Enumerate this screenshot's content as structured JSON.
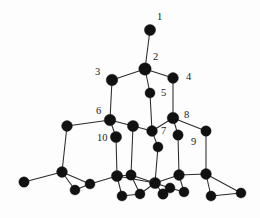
{
  "figure": {
    "name": "crystal-lattice-diagram",
    "background_color": "#fdfdfd",
    "atom_color": "#111111",
    "bond_color": "#2b2b2b",
    "label_color": "#1a1a1a",
    "width": 260,
    "height": 218
  },
  "chart_data": {
    "type": "scatter",
    "title": "",
    "subtitle": "",
    "xlabel": "",
    "ylabel": "",
    "xlim": [
      0,
      260
    ],
    "ylim": [
      0,
      218
    ],
    "grid": false,
    "legend": null,
    "atom_radius_large": 5.6,
    "atom_radius_small": 4.6,
    "nodes": [
      {
        "id": "n1",
        "label": "1",
        "x": 150,
        "y": 30,
        "r": 5.6,
        "label_x": 157,
        "label_y": 12
      },
      {
        "id": "n2",
        "label": "2",
        "x": 145,
        "y": 69,
        "r": 6.2,
        "label_x": 153,
        "label_y": 52
      },
      {
        "id": "n3",
        "label": "3",
        "x": 112,
        "y": 80,
        "r": 5.8,
        "label_x": 95,
        "label_y": 67
      },
      {
        "id": "n4",
        "label": "4",
        "x": 173,
        "y": 78,
        "r": 5.4,
        "label_x": 186,
        "label_y": 72
      },
      {
        "id": "n5",
        "label": "5",
        "x": 150,
        "y": 93,
        "r": 5.0,
        "label_x": 161,
        "label_y": 88
      },
      {
        "id": "n6",
        "label": "6",
        "x": 110,
        "y": 120,
        "r": 5.8,
        "label_x": 96,
        "label_y": 106
      },
      {
        "id": "n7",
        "label": "7",
        "x": 152,
        "y": 131,
        "r": 5.4,
        "label_x": 161,
        "label_y": 126
      },
      {
        "id": "n8",
        "label": "8",
        "x": 173,
        "y": 118,
        "r": 5.8,
        "label_x": 184,
        "label_y": 110
      },
      {
        "id": "n9",
        "label": "9",
        "x": 178,
        "y": 135,
        "r": 5.2,
        "label_x": 191,
        "label_y": 137
      },
      {
        "id": "n10",
        "label": "10",
        "x": 116,
        "y": 137,
        "r": 5.6,
        "label_x": 97,
        "label_y": 133
      },
      {
        "id": "a1",
        "label": "",
        "x": 133,
        "y": 126,
        "r": 5.6,
        "label_x": null,
        "label_y": null
      },
      {
        "id": "a2",
        "label": "",
        "x": 67,
        "y": 126,
        "r": 5.4,
        "label_x": null,
        "label_y": null
      },
      {
        "id": "a3",
        "label": "",
        "x": 206,
        "y": 131,
        "r": 5.2,
        "label_x": null,
        "label_y": null
      },
      {
        "id": "a4",
        "label": "",
        "x": 158,
        "y": 147,
        "r": 5.0,
        "label_x": null,
        "label_y": null
      },
      {
        "id": "a5",
        "label": "",
        "x": 62,
        "y": 172,
        "r": 5.4,
        "label_x": null,
        "label_y": null
      },
      {
        "id": "a6",
        "label": "",
        "x": 24,
        "y": 182,
        "r": 5.2,
        "label_x": null,
        "label_y": null
      },
      {
        "id": "a7",
        "label": "",
        "x": 75,
        "y": 190,
        "r": 5.0,
        "label_x": null,
        "label_y": null
      },
      {
        "id": "a8",
        "label": "",
        "x": 90,
        "y": 184,
        "r": 5.0,
        "label_x": null,
        "label_y": null
      },
      {
        "id": "a9",
        "label": "",
        "x": 117,
        "y": 176,
        "r": 5.6,
        "label_x": null,
        "label_y": null
      },
      {
        "id": "a10",
        "label": "",
        "x": 131,
        "y": 175,
        "r": 5.2,
        "label_x": null,
        "label_y": null
      },
      {
        "id": "a11",
        "label": "",
        "x": 122,
        "y": 196,
        "r": 5.0,
        "label_x": null,
        "label_y": null
      },
      {
        "id": "a12",
        "label": "",
        "x": 140,
        "y": 194,
        "r": 5.0,
        "label_x": null,
        "label_y": null
      },
      {
        "id": "a13",
        "label": "",
        "x": 155,
        "y": 183,
        "r": 5.6,
        "label_x": null,
        "label_y": null
      },
      {
        "id": "a14",
        "label": "",
        "x": 163,
        "y": 194,
        "r": 5.2,
        "label_x": null,
        "label_y": null
      },
      {
        "id": "a15",
        "label": "",
        "x": 170,
        "y": 188,
        "r": 5.0,
        "label_x": null,
        "label_y": null
      },
      {
        "id": "a16",
        "label": "",
        "x": 179,
        "y": 175,
        "r": 5.4,
        "label_x": null,
        "label_y": null
      },
      {
        "id": "a17",
        "label": "",
        "x": 184,
        "y": 192,
        "r": 5.0,
        "label_x": null,
        "label_y": null
      },
      {
        "id": "a18",
        "label": "",
        "x": 206,
        "y": 174,
        "r": 5.4,
        "label_x": null,
        "label_y": null
      },
      {
        "id": "a19",
        "label": "",
        "x": 211,
        "y": 196,
        "r": 5.0,
        "label_x": null,
        "label_y": null
      },
      {
        "id": "a20",
        "label": "",
        "x": 241,
        "y": 193,
        "r": 5.0,
        "label_x": null,
        "label_y": null
      }
    ],
    "edges": [
      [
        "n1",
        "n2"
      ],
      [
        "n2",
        "n3"
      ],
      [
        "n2",
        "n4"
      ],
      [
        "n2",
        "n5"
      ],
      [
        "n3",
        "n6"
      ],
      [
        "n4",
        "n8"
      ],
      [
        "n5",
        "n7"
      ],
      [
        "n6",
        "a1"
      ],
      [
        "n6",
        "n10"
      ],
      [
        "n6",
        "a2"
      ],
      [
        "a1",
        "n7"
      ],
      [
        "n7",
        "n8"
      ],
      [
        "n7",
        "a4"
      ],
      [
        "n8",
        "n9"
      ],
      [
        "n8",
        "a3"
      ],
      [
        "a2",
        "a5"
      ],
      [
        "a3",
        "a18"
      ],
      [
        "n9",
        "a16"
      ],
      [
        "a4",
        "a13"
      ],
      [
        "n10",
        "a9"
      ],
      [
        "a1",
        "a10"
      ],
      [
        "a5",
        "a6"
      ],
      [
        "a5",
        "a7"
      ],
      [
        "a5",
        "a8"
      ],
      [
        "a7",
        "a8"
      ],
      [
        "a8",
        "a9"
      ],
      [
        "a9",
        "a10"
      ],
      [
        "a9",
        "a11"
      ],
      [
        "a10",
        "a12"
      ],
      [
        "a11",
        "a12"
      ],
      [
        "a12",
        "a13"
      ],
      [
        "a13",
        "a14"
      ],
      [
        "a13",
        "a15"
      ],
      [
        "a13",
        "a16"
      ],
      [
        "a14",
        "a15"
      ],
      [
        "a15",
        "a17"
      ],
      [
        "a16",
        "a17"
      ],
      [
        "a16",
        "a18"
      ],
      [
        "a18",
        "a19"
      ],
      [
        "a18",
        "a20"
      ],
      [
        "a19",
        "a20"
      ],
      [
        "a9",
        "a13"
      ],
      [
        "a10",
        "a13"
      ]
    ]
  }
}
